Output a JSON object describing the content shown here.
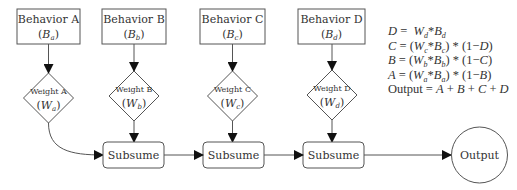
{
  "behaviors": [
    {
      "label": "Behavior A",
      "symbol": "B",
      "sub": "a"
    },
    {
      "label": "Behavior B",
      "symbol": "B",
      "sub": "b"
    },
    {
      "label": "Behavior C",
      "symbol": "B",
      "sub": "c"
    },
    {
      "label": "Behavior D",
      "symbol": "B",
      "sub": "d"
    }
  ],
  "weights": [
    {
      "label": "Weight A",
      "symbol": "W",
      "sub": "a"
    },
    {
      "label": "Weight B",
      "symbol": "W",
      "sub": "b"
    },
    {
      "label": "Weight C",
      "symbol": "W",
      "sub": "c"
    },
    {
      "label": "Weight D",
      "symbol": "W",
      "sub": "d"
    }
  ],
  "subsume": [
    {
      "label": "Subsume"
    },
    {
      "label": "Subsume"
    },
    {
      "label": "Subsume"
    }
  ],
  "output": {
    "label": "Output"
  },
  "equations": [
    {
      "lhs": "D",
      "rhs": "W_d*B_d"
    },
    {
      "lhs": "C",
      "rhs": "(W_c*B_c) * (1−D)"
    },
    {
      "lhs": "B",
      "rhs": "(W_b*B_b) * (1−C)"
    },
    {
      "lhs": "A",
      "rhs": "(W_a*B_a) * (1−B)"
    },
    {
      "lhs": "Output",
      "rhs": "A + B + C + D"
    }
  ],
  "colors": {
    "stroke": "#555555",
    "text": "#333333",
    "background": "#ffffff"
  }
}
